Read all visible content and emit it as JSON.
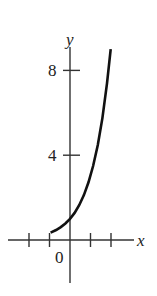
{
  "chart_data": {
    "type": "line",
    "title": "",
    "xlabel": "x",
    "ylabel": "y",
    "xlim": [
      -3,
      3
    ],
    "ylim": [
      -2,
      9
    ],
    "grid": false,
    "legend": null,
    "x_ticks": [
      -2,
      -1,
      0,
      1,
      2
    ],
    "y_ticks": [
      4,
      8
    ],
    "tick_labels": {
      "x": [
        "0"
      ],
      "y": [
        "4",
        "8"
      ]
    },
    "origin_label": "0",
    "series": [
      {
        "name": "curve",
        "x": [
          -1.05,
          -0.75,
          -0.5,
          -0.25,
          0,
          0.25,
          0.5,
          0.75,
          1.0,
          1.25,
          1.5,
          1.75,
          2.0,
          2.2
        ],
        "values": [
          0.35,
          0.47,
          0.61,
          0.78,
          1.0,
          1.28,
          1.65,
          2.12,
          2.72,
          3.49,
          4.48,
          5.75,
          7.39,
          9.0
        ]
      }
    ],
    "colors": {
      "axis": "#333333",
      "curve": "#111111",
      "text": "#222222"
    }
  },
  "labels": {
    "x_axis": "x",
    "y_axis": "y",
    "origin": "0",
    "y_tick_4": "4",
    "y_tick_8": "8"
  }
}
